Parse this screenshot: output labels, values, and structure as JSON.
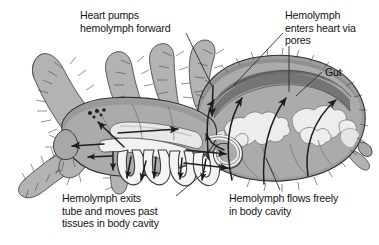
{
  "figure": {
    "organism": "spider",
    "background_color": "#ffffff",
    "ink_color": "#131313"
  },
  "palette": {
    "body_gray": "#a9a9a9",
    "body_gray_dark": "#8d8d8d",
    "heart_band": "#787878",
    "cuticle_edge": "#9b9b9b",
    "gut_light": "#e9e9e9",
    "vessel_white": "#f4f4f4",
    "leg_gray": "#b4b4b4",
    "outline": "#2a2a2a",
    "leader_line": "#2a2a2a"
  },
  "labels": [
    {
      "id": "heart-pumps",
      "name": "label-heart-pumps-hemolymph-forward",
      "lines": [
        "Heart pumps",
        "hemolymph forward"
      ],
      "text": "Heart pumps hemolymph forward",
      "x": 80,
      "y": 9,
      "align": "left"
    },
    {
      "id": "enters-heart",
      "name": "label-hemolymph-enters-heart-via-pores",
      "lines": [
        "Hemolymph",
        "enters heart via",
        "pores"
      ],
      "text": "Hemolymph enters heart via pores",
      "x": 285,
      "y": 9,
      "align": "left"
    },
    {
      "id": "gut",
      "name": "label-gut",
      "lines": [
        "Gut"
      ],
      "text": "Gut",
      "x": 325,
      "y": 66,
      "align": "left"
    },
    {
      "id": "exits-tube",
      "name": "label-hemolymph-exits-tube",
      "lines": [
        "Hemolymph exits",
        "tube and moves past",
        "tissues in body cavity"
      ],
      "text": "Hemolymph exits tube and moves past tissues in body cavity",
      "x": 62,
      "y": 192,
      "align": "left"
    },
    {
      "id": "flows-freely",
      "name": "label-hemolymph-flows-freely",
      "lines": [
        "Hemolymph flows freely",
        "in body cavity"
      ],
      "text": "Hemolymph flows freely in body cavity",
      "x": 229,
      "y": 192,
      "align": "left"
    }
  ],
  "leader_lines": [
    {
      "id": "ll-heart-pumps",
      "name": "leader-line-heart-pumps",
      "from": [
        186,
        33
      ],
      "to": [
        212,
        86
      ]
    },
    {
      "id": "ll-enters-heart-a",
      "name": "leader-line-enters-heart-left",
      "from": [
        283,
        33
      ],
      "to": [
        234,
        85
      ]
    },
    {
      "id": "ll-enters-heart-b",
      "name": "leader-line-enters-heart-right",
      "from": [
        289,
        46
      ],
      "to": [
        289,
        92
      ]
    },
    {
      "id": "ll-gut",
      "name": "leader-line-gut",
      "from": [
        322,
        72
      ],
      "to": [
        296,
        96
      ]
    },
    {
      "id": "ll-exits-tube",
      "name": "leader-line-exits-tube",
      "from": [
        176,
        196
      ],
      "to": [
        206,
        171
      ]
    },
    {
      "id": "ll-flows-freely",
      "name": "leader-line-flows-freely",
      "from": [
        280,
        190
      ],
      "to": [
        266,
        158
      ]
    }
  ],
  "anatomy": [
    {
      "id": "abdomen",
      "name": "abdomen-opisthosoma",
      "description": "large oval abdomen shown in cutaway"
    },
    {
      "id": "heart",
      "name": "heart-dorsal-vessel",
      "description": "dark band along dorsal edge of abdomen"
    },
    {
      "id": "gut-diverticula",
      "name": "gut-diverticula",
      "description": "pale branched digestive gland lobes"
    },
    {
      "id": "cephalothorax",
      "name": "cephalothorax-prosoma",
      "description": "front body section with eyes"
    },
    {
      "id": "eyes",
      "name": "eye-cluster",
      "description": "cluster of small dark eyes"
    },
    {
      "id": "aorta",
      "name": "anterior-aorta-tube",
      "description": "pale tube carrying hemolymph forward"
    },
    {
      "id": "leg-vessels",
      "name": "leg-branch-vessels",
      "description": "looping vessel branches into leg bases"
    },
    {
      "id": "legs",
      "name": "hairy-legs",
      "description": "eight hairy walking legs"
    }
  ],
  "flow_arrows": [
    {
      "name": "flow-arrow-forward-aorta",
      "direction": "forward"
    },
    {
      "name": "flow-arrow-into-head",
      "direction": "forward-left"
    },
    {
      "name": "flow-arrow-out-of-head",
      "direction": "left"
    },
    {
      "name": "flow-arrow-down-leg-1",
      "direction": "down"
    },
    {
      "name": "flow-arrow-down-leg-2",
      "direction": "down"
    },
    {
      "name": "flow-arrow-down-leg-3",
      "direction": "down"
    },
    {
      "name": "flow-arrow-down-leg-4",
      "direction": "down"
    },
    {
      "name": "flow-arrow-rear-1",
      "direction": "right"
    },
    {
      "name": "flow-arrow-rear-2",
      "direction": "right"
    },
    {
      "name": "flow-arrow-into-heart-left",
      "direction": "up-right"
    },
    {
      "name": "flow-arrow-into-heart-mid",
      "direction": "up-right"
    },
    {
      "name": "flow-arrow-into-heart-right",
      "direction": "up-right"
    },
    {
      "name": "flow-arrow-pore-down",
      "direction": "down"
    }
  ]
}
